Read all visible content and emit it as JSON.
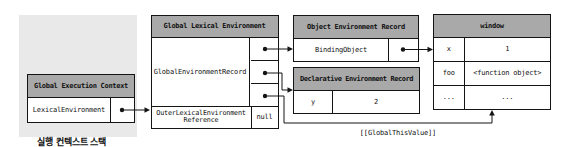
{
  "colors": {
    "header_bg": "#a9a9a9",
    "stack_bg": "#e9e9e9",
    "line": "#141414",
    "background": "#ffffff"
  },
  "stack": {
    "caption": "실행 컨텍스트 스택",
    "box_title": "Global Execution Context",
    "row_label": "LexicalEnvironment"
  },
  "global_lexical_environment": {
    "title": "Global Lexical Environment",
    "record_label": "GlobalEnvironmentRecord",
    "outer_ref_line1": "OuterLexicalEnvironment",
    "outer_ref_line2": "Reference",
    "outer_ref_value": "null"
  },
  "object_environment_record": {
    "title": "Object Environment Record",
    "binding_label": "BindingObject"
  },
  "declarative_environment_record": {
    "title": "Declarative Environment Record",
    "rows": [
      {
        "key": "y",
        "value": "2"
      }
    ]
  },
  "window_object": {
    "title": "window",
    "rows": [
      {
        "key": "x",
        "value": "1"
      },
      {
        "key": "foo",
        "value": "<function object>"
      },
      {
        "key": "...",
        "value": "..."
      }
    ]
  },
  "annotations": {
    "global_this_value": "[[GlobalThisValue]]"
  }
}
